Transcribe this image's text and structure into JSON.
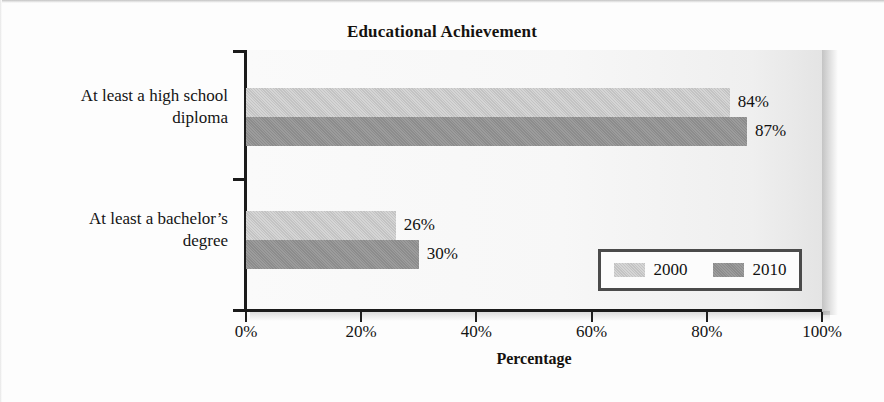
{
  "chart_data": {
    "type": "bar",
    "orientation": "horizontal",
    "title": "Educational Achievement",
    "xlabel": "Percentage",
    "ylabel": "",
    "categories": [
      "At least a high school diploma",
      "At least a bachelor’s degree"
    ],
    "category_lines": [
      [
        "At least a high school",
        "diploma"
      ],
      [
        "At least a bachelor’s",
        "degree"
      ]
    ],
    "series": [
      {
        "name": "2000",
        "values": [
          84,
          30
        ],
        "color": "#c3c3c3"
      },
      {
        "name": "2010",
        "values": [
          87,
          30
        ],
        "color": "#8c8c8c"
      }
    ],
    "series_corrected": [
      {
        "name": "2000",
        "values": [
          84,
          26
        ],
        "color": "#c3c3c3"
      },
      {
        "name": "2010",
        "values": [
          87,
          30
        ],
        "color": "#8c8c8c"
      }
    ],
    "data_labels": [
      [
        "84%",
        "26%"
      ],
      [
        "87%",
        "30%"
      ]
    ],
    "xlim": [
      0,
      100
    ],
    "xticks": [
      0,
      20,
      40,
      60,
      80,
      100
    ],
    "xtick_labels": [
      "0%",
      "20%",
      "40%",
      "60%",
      "80%",
      "100%"
    ],
    "grid": false,
    "legend_position": "lower-right",
    "legend_entries": [
      "2000",
      "2010"
    ]
  },
  "legend": {
    "entries": [
      {
        "label": "2000",
        "color": "#c3c3c3"
      },
      {
        "label": "2010",
        "color": "#8c8c8c"
      }
    ]
  }
}
